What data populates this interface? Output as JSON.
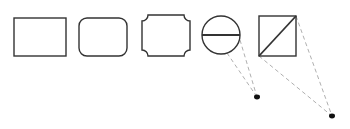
{
  "diagram": {
    "stroke_color": "#333333",
    "dash_color": "#b0b0b0",
    "dot_color": "#111111",
    "shapes": [
      {
        "name": "rectangle",
        "x": 14,
        "y": 18,
        "w": 52,
        "h": 38
      },
      {
        "name": "rounded-rectangle",
        "x": 79,
        "y": 18,
        "w": 48,
        "h": 38,
        "radius": 8
      },
      {
        "name": "notched-rectangle",
        "x": 142,
        "y": 15,
        "w": 48,
        "h": 41,
        "notch": 6
      },
      {
        "name": "circle-with-horizontal-line",
        "cx": 221,
        "cy": 35,
        "r": 19
      },
      {
        "name": "square-with-diagonal",
        "x": 259,
        "y": 16,
        "w": 37,
        "h": 40
      }
    ],
    "connectors": [
      {
        "from": [
          227,
          53
        ],
        "to": [
          257,
          97
        ]
      },
      {
        "from": [
          240,
          40
        ],
        "to": [
          257,
          97
        ]
      },
      {
        "from": [
          259,
          56
        ],
        "to": [
          332,
          116
        ]
      },
      {
        "from": [
          296,
          16
        ],
        "to": [
          332,
          116
        ]
      }
    ],
    "anchor_points": [
      {
        "x": 257,
        "y": 97
      },
      {
        "x": 332,
        "y": 116
      }
    ]
  }
}
